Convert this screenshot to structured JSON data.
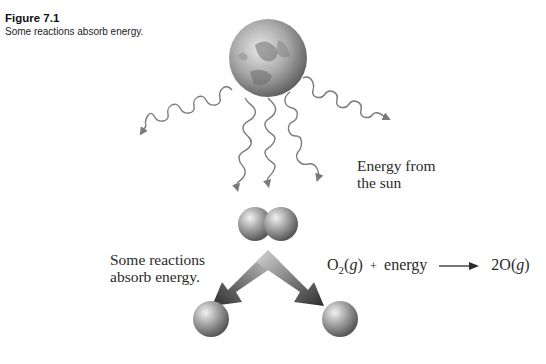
{
  "figure": {
    "title": "Figure 7.1",
    "caption": "Some reactions absorb energy."
  },
  "labels": {
    "energy_source": [
      "Energy from",
      "the sun"
    ],
    "reaction_note": [
      "Some reactions",
      "absorb energy."
    ]
  },
  "equation": {
    "reactant": "O",
    "reactant_subscript": "2",
    "reactant_state": "g",
    "plus": "+",
    "energy": "energy",
    "product_coeff": "2O",
    "product_state": "g"
  },
  "elements": {
    "sun": "sun-globe",
    "molecule": "O2-molecule",
    "atoms": [
      "O-atom",
      "O-atom"
    ]
  },
  "colors": {
    "wave": "#7a7a7a",
    "atom_light": "#e6e6e6",
    "atom_dark": "#5a5a5a",
    "arrow_light": "#d0d0d0",
    "arrow_dark": "#2b2b2b"
  }
}
